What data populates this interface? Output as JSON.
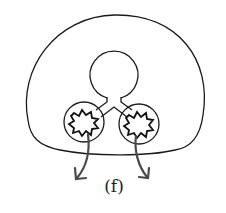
{
  "figure": {
    "label": "(f)",
    "elements": {
      "outer_body": "outer-membrane",
      "central_vesicle": "central-circle",
      "left_lobe": "left-circle-with-starburst",
      "right_lobe": "right-circle-with-starburst",
      "connecting_duct": "y-shaped-tube",
      "left_arrow": "outflow-arrow-left",
      "right_arrow": "outflow-arrow-right"
    },
    "colors": {
      "stroke": "#1a1a1a",
      "arrow": "#4a4a4a",
      "background": "#ffffff"
    }
  }
}
